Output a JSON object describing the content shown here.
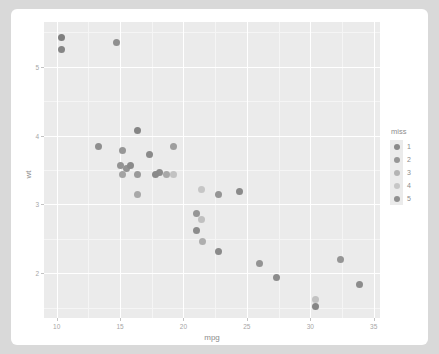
{
  "chart_data": {
    "type": "scatter",
    "title": "",
    "xlabel": "mpg",
    "ylabel": "wt",
    "xlim": [
      9.0,
      35.5
    ],
    "ylim": [
      1.35,
      5.65
    ],
    "xticks": [
      10,
      15,
      20,
      25,
      30,
      35
    ],
    "xticklabels": [
      "10",
      "15",
      "20",
      "25",
      "30",
      "35"
    ],
    "yticks": [
      2,
      3,
      4,
      5
    ],
    "yticklabels": [
      "2",
      "3",
      "4",
      "5"
    ],
    "grid": true,
    "legend_position": "right",
    "legend": {
      "title": "miss",
      "entries": [
        {
          "label": "1",
          "color": "#8a8a8a"
        },
        {
          "label": "2",
          "color": "#969696"
        },
        {
          "label": "3",
          "color": "#b4b4b4"
        },
        {
          "label": "4",
          "color": "#c6c6c6"
        },
        {
          "label": "5",
          "color": "#8f8f8f"
        }
      ]
    },
    "colors": {
      "panel_background": "#ebebeb",
      "grid_major": "#ffffff",
      "grid_minor": "#f5f5f5",
      "axis_text": "#a6a6a6",
      "axis_title": "#8c8c8c",
      "card_background": "#ffffff",
      "page_background": "#d9d9d9"
    },
    "points": [
      {
        "x": 10.4,
        "y": 5.424,
        "miss": 1,
        "color": "#7f7f7f"
      },
      {
        "x": 10.4,
        "y": 5.25,
        "miss": 1,
        "color": "#858585"
      },
      {
        "x": 14.7,
        "y": 5.345,
        "miss": 2,
        "color": "#8f8f8f"
      },
      {
        "x": 16.4,
        "y": 4.07,
        "miss": 1,
        "color": "#858585"
      },
      {
        "x": 13.3,
        "y": 3.84,
        "miss": 2,
        "color": "#8f8f8f"
      },
      {
        "x": 15.2,
        "y": 3.78,
        "miss": 2,
        "color": "#979797"
      },
      {
        "x": 17.3,
        "y": 3.73,
        "miss": 1,
        "color": "#8a8a8a"
      },
      {
        "x": 19.2,
        "y": 3.845,
        "miss": 3,
        "color": "#9e9e9e"
      },
      {
        "x": 15.5,
        "y": 3.52,
        "miss": 2,
        "color": "#939393"
      },
      {
        "x": 15.2,
        "y": 3.435,
        "miss": 3,
        "color": "#a3a3a3"
      },
      {
        "x": 16.4,
        "y": 3.44,
        "miss": 2,
        "color": "#9a9a9a"
      },
      {
        "x": 15.8,
        "y": 3.57,
        "miss": 1,
        "color": "#8a8a8a"
      },
      {
        "x": 15.0,
        "y": 3.57,
        "miss": 2,
        "color": "#949494"
      },
      {
        "x": 18.1,
        "y": 3.46,
        "miss": 1,
        "color": "#8c8c8c"
      },
      {
        "x": 18.7,
        "y": 3.44,
        "miss": 3,
        "color": "#a8a8a8"
      },
      {
        "x": 19.2,
        "y": 3.44,
        "miss": 4,
        "color": "#c2c2c2"
      },
      {
        "x": 17.8,
        "y": 3.44,
        "miss": 1,
        "color": "#8a8a8a"
      },
      {
        "x": 16.4,
        "y": 3.15,
        "miss": 3,
        "color": "#a8a8a8"
      },
      {
        "x": 21.4,
        "y": 3.215,
        "miss": 4,
        "color": "#c6c6c6"
      },
      {
        "x": 22.8,
        "y": 3.15,
        "miss": 2,
        "color": "#959595"
      },
      {
        "x": 24.4,
        "y": 3.19,
        "miss": 1,
        "color": "#8a8a8a"
      },
      {
        "x": 21.0,
        "y": 2.875,
        "miss": 2,
        "color": "#969696"
      },
      {
        "x": 21.0,
        "y": 2.62,
        "miss": 1,
        "color": "#8c8c8c"
      },
      {
        "x": 21.5,
        "y": 2.465,
        "miss": 3,
        "color": "#aeaeae"
      },
      {
        "x": 21.4,
        "y": 2.78,
        "miss": 4,
        "color": "#c0c0c0"
      },
      {
        "x": 22.8,
        "y": 2.32,
        "miss": 1,
        "color": "#8a8a8a"
      },
      {
        "x": 26.0,
        "y": 2.14,
        "miss": 2,
        "color": "#939393"
      },
      {
        "x": 27.3,
        "y": 1.935,
        "miss": 1,
        "color": "#8c8c8c"
      },
      {
        "x": 30.4,
        "y": 1.615,
        "miss": 4,
        "color": "#c2c2c2"
      },
      {
        "x": 30.4,
        "y": 1.513,
        "miss": 1,
        "color": "#868686"
      },
      {
        "x": 32.4,
        "y": 2.2,
        "miss": 2,
        "color": "#959595"
      },
      {
        "x": 33.9,
        "y": 1.835,
        "miss": 1,
        "color": "#8c8c8c"
      }
    ]
  }
}
